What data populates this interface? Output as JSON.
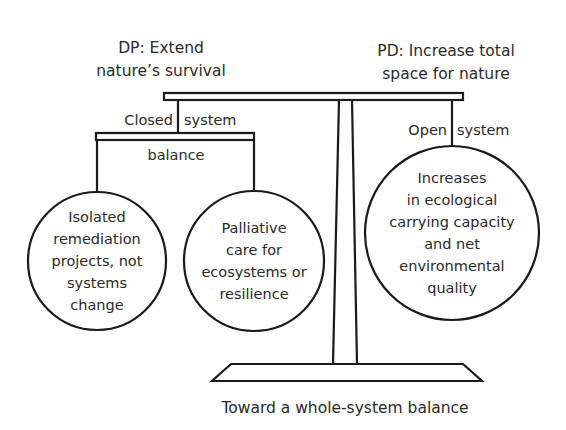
{
  "diagram": {
    "left_title": {
      "lines": [
        "DP: Extend",
        "nature’s survival"
      ]
    },
    "right_title": {
      "lines": [
        "PD: Increase total",
        "space for nature"
      ]
    },
    "left_branch": {
      "label_left": "Closed",
      "label_right": "system",
      "sub_label": "balance",
      "circles": [
        {
          "lines": [
            "Isolated",
            "remediation",
            "projects, not",
            "systems",
            "change"
          ]
        },
        {
          "lines": [
            "Palliative",
            "care for",
            "ecosystems or",
            "resilience"
          ]
        }
      ]
    },
    "right_branch": {
      "label_left": "Open",
      "label_right": "system",
      "circle": {
        "lines": [
          "Increases",
          "in ecological",
          "carrying capacity",
          "and net",
          "environmental",
          "quality"
        ]
      }
    },
    "caption": "Toward a whole-system balance",
    "colors": {
      "line": "#1a1a1a",
      "text": "#2a2a2a",
      "background": "#ffffff"
    }
  }
}
